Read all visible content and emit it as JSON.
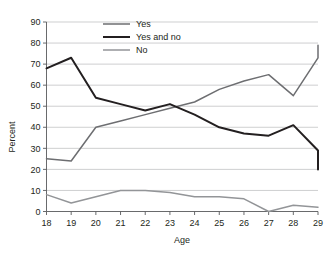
{
  "chart_data": {
    "type": "line",
    "title": "",
    "xlabel": "Age",
    "ylabel": "Percent",
    "x": [
      18,
      19,
      20,
      21,
      22,
      23,
      24,
      25,
      26,
      27,
      28,
      29
    ],
    "categories": [
      "18",
      "19",
      "20",
      "21",
      "22",
      "23",
      "24",
      "25",
      "26",
      "27",
      "28",
      "29"
    ],
    "xlim": [
      18,
      29
    ],
    "ylim": [
      0,
      90
    ],
    "yticks": [
      0,
      10,
      20,
      30,
      40,
      50,
      60,
      70,
      80,
      90
    ],
    "ytick_labels": [
      "0",
      "10",
      "20",
      "30",
      "40",
      "50",
      "60",
      "70",
      "80",
      "90"
    ],
    "grid": true,
    "grid_axis": "y",
    "legend_position": "top-center",
    "series": [
      {
        "name": "Yes",
        "color": "#6d6e71",
        "values": [
          25,
          24,
          40,
          43,
          46,
          49,
          52,
          58,
          62,
          65,
          55,
          73
        ]
      },
      {
        "name": "Yes and no",
        "color": "#231f20",
        "values": [
          68,
          73,
          54,
          51,
          48,
          51,
          46,
          40,
          37,
          36,
          41,
          29
        ]
      },
      {
        "name": "No",
        "color": "#939598",
        "values": [
          8,
          4,
          7,
          10,
          10,
          9,
          7,
          7,
          6,
          0,
          3,
          2
        ]
      }
    ],
    "endpoint_age_29": {
      "Yes": 79,
      "Yes and no": 20,
      "No": 2
    }
  },
  "legend": {
    "items": [
      {
        "label": "Yes",
        "color": "#6d6e71"
      },
      {
        "label": "Yes and no",
        "color": "#231f20"
      },
      {
        "label": "No",
        "color": "#939598"
      }
    ]
  },
  "axes": {
    "y_title": "Percent",
    "x_title": "Age"
  }
}
